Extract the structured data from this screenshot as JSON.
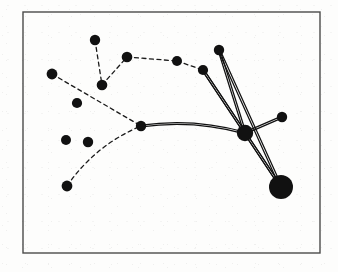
{
  "figure": {
    "background_color": "#fdfdfc",
    "ink_color": "#111111",
    "frame": {
      "label": "figure-border",
      "x": 23,
      "y": 12,
      "width": 297,
      "height": 241,
      "stroke_color": "#4a4a4a",
      "stroke_width": 1.4
    },
    "node_style": {
      "fill_color": "#111111",
      "default_radius": 5.2
    },
    "edge_styles": {
      "dashed": {
        "stroke_color": "#1a1a1a",
        "stroke_width": 1.3,
        "dash_pattern": "4 3.5"
      },
      "solid": {
        "stroke_color": "#111111",
        "stroke_width": 1.25,
        "double_offset": 1.9
      }
    },
    "nodes": [
      {
        "id": "n1",
        "label": "top-spur-node",
        "x": 95,
        "y": 40,
        "r": 5.2
      },
      {
        "id": "n2",
        "label": "upper-left-node",
        "x": 52,
        "y": 74,
        "r": 5.4
      },
      {
        "id": "n3",
        "label": "chain-elbow-node",
        "x": 102,
        "y": 85,
        "r": 5.3
      },
      {
        "id": "n4",
        "label": "chain-node-a",
        "x": 127,
        "y": 57,
        "r": 5.3
      },
      {
        "id": "n5",
        "label": "chain-node-b",
        "x": 177,
        "y": 61,
        "r": 5.0
      },
      {
        "id": "n6",
        "label": "chain-node-c",
        "x": 203,
        "y": 70,
        "r": 5.1
      },
      {
        "id": "n7",
        "label": "upper-right-node",
        "x": 219,
        "y": 50,
        "r": 5.2
      },
      {
        "id": "n8",
        "label": "junction-node",
        "x": 141,
        "y": 126,
        "r": 5.2
      },
      {
        "id": "n9",
        "label": "hub-node",
        "x": 245,
        "y": 133,
        "r": 8.2
      },
      {
        "id": "n10",
        "label": "right-leaf-node",
        "x": 282,
        "y": 117,
        "r": 5.2
      },
      {
        "id": "n11",
        "label": "large-terminal-node",
        "x": 281,
        "y": 187,
        "r": 12.0
      },
      {
        "id": "n12",
        "label": "lower-left-node",
        "x": 67,
        "y": 186,
        "r": 5.4
      },
      {
        "id": "n13",
        "label": "isolated-node-a",
        "x": 66,
        "y": 140,
        "r": 5.0
      },
      {
        "id": "n14",
        "label": "isolated-node-b",
        "x": 88,
        "y": 142,
        "r": 5.2
      },
      {
        "id": "n15",
        "label": "isolated-node-c",
        "x": 77,
        "y": 103,
        "r": 5.1
      }
    ],
    "edges": [
      {
        "id": "e1",
        "label": "edge-top-spur",
        "from": "n1",
        "to": "n3",
        "style": "dashed"
      },
      {
        "id": "e2",
        "label": "edge-elbow-to-chain",
        "from": "n3",
        "to": "n4",
        "style": "dashed"
      },
      {
        "id": "e3",
        "label": "edge-chain-a-b",
        "from": "n4",
        "to": "n5",
        "style": "dashed"
      },
      {
        "id": "e4",
        "label": "edge-chain-b-c",
        "from": "n5",
        "to": "n6",
        "style": "dashed"
      },
      {
        "id": "e5",
        "label": "edge-left-to-junction",
        "from": "n2",
        "to": "n8",
        "style": "dashed"
      },
      {
        "id": "e6",
        "label": "edge-lower-left-to-junction",
        "from": "n12",
        "to": "n8",
        "style": "dashed",
        "curve": -14
      },
      {
        "id": "e7",
        "label": "edge-junction-to-hub",
        "from": "n8",
        "to": "n9",
        "style": "solid",
        "curve": -11
      },
      {
        "id": "e8",
        "label": "edge-hub-to-chain-c",
        "from": "n9",
        "to": "n6",
        "style": "solid"
      },
      {
        "id": "e9",
        "label": "edge-hub-to-upper-right",
        "from": "n9",
        "to": "n7",
        "style": "solid"
      },
      {
        "id": "e10",
        "label": "edge-hub-to-right-leaf",
        "from": "n9",
        "to": "n10",
        "style": "solid"
      },
      {
        "id": "e11",
        "label": "edge-hub-to-terminal",
        "from": "n9",
        "to": "n11",
        "style": "solid"
      },
      {
        "id": "e12",
        "label": "edge-chain-c-to-terminal",
        "from": "n6",
        "to": "n11",
        "style": "solid"
      },
      {
        "id": "e13",
        "label": "edge-upper-right-to-terminal",
        "from": "n7",
        "to": "n11",
        "style": "solid"
      }
    ]
  }
}
